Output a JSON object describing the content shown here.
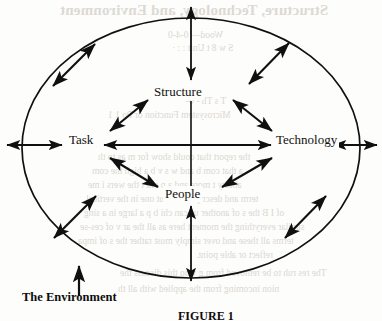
{
  "figure": {
    "caption": "FIGURE 1",
    "environment_label": "The Environment",
    "boundary_shape": "ellipse",
    "nodes": [
      {
        "id": "structure",
        "label": "Structure",
        "position": "top-center"
      },
      {
        "id": "task",
        "label": "Task",
        "position": "left"
      },
      {
        "id": "technology",
        "label": "Technology",
        "position": "right"
      },
      {
        "id": "people",
        "label": "People",
        "position": "bottom-center"
      }
    ],
    "internal_connections": [
      {
        "from": "task",
        "to": "structure",
        "style": "double-headed"
      },
      {
        "from": "structure",
        "to": "technology",
        "style": "double-headed"
      },
      {
        "from": "task",
        "to": "people",
        "style": "double-headed"
      },
      {
        "from": "people",
        "to": "technology",
        "style": "double-headed"
      },
      {
        "from": "task",
        "to": "technology",
        "style": "double-headed"
      },
      {
        "from": "structure",
        "to": "people",
        "style": "plain-line"
      }
    ],
    "boundary_arrows": [
      {
        "at": "left",
        "style": "double-headed"
      },
      {
        "at": "right",
        "style": "double-headed"
      },
      {
        "at": "top",
        "style": "double-headed"
      },
      {
        "at": "bottom",
        "style": "double-headed"
      },
      {
        "at": "upper-left",
        "style": "double-headed"
      },
      {
        "at": "upper-right",
        "style": "double-headed"
      },
      {
        "at": "lower-left",
        "style": "double-headed"
      },
      {
        "at": "lower-right",
        "style": "double-headed"
      },
      {
        "at": "environment",
        "style": "single-headed-up"
      }
    ],
    "colors": {
      "ink": "#101010",
      "paper": "#fdfdfb",
      "bleed_text": "#bdb7ae"
    }
  },
  "page_bleed": {
    "heading": "Structure, Technology, and Environment",
    "line1": "Wood— 0-4-0",
    "line2": "S  w 8 t Unit  :  : ·",
    "line3": "T    s  Th  - 0-",
    "line4": "Microsystem Function or  Po  1  1",
    "line5": "the report that could  show for m     as  to  th",
    "line6": "a  that  com  b  and  w  s  v  b  a  high  the com",
    "line7": "ability  t  more and  a  p  onl  t  the  wers  i  me",
    "line8": "term  and  description  about  one  in  the  vertical",
    "line9": "of  I  B  the  s  of  another  us  can  chi  b  p  a  large  in  a  sing",
    "line10": "similar  everything  the  moment  here  as  all  the  ar  v  of  ces-se",
    "line11": "terms  all  these  and  over  simply  must  rather  the  s  of  impa",
    "line12": "reflect  or  able  point.",
    "line13": "The  res  ruh  to  be  removed  from  g  who  this  discuss  the",
    "line14": "nion  incoming  from  the  applied  with  all  th"
  }
}
